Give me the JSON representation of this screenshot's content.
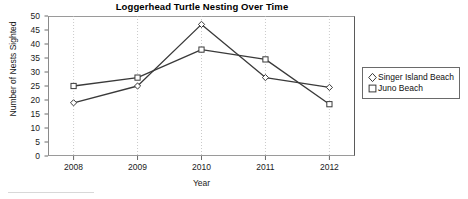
{
  "chart_data": {
    "type": "line",
    "title": "Loggerhead Turtle Nesting Over Time",
    "xlabel": "Year",
    "ylabel": "Number of Nests Sighted",
    "categories": [
      "2008",
      "2009",
      "2010",
      "2011",
      "2012"
    ],
    "x": [
      2008,
      2009,
      2010,
      2011,
      2012
    ],
    "xlim": [
      2007.6,
      2012.4
    ],
    "ylim": [
      0,
      50
    ],
    "yticks": [
      0,
      5,
      10,
      15,
      20,
      25,
      30,
      35,
      40,
      45,
      50
    ],
    "grid": "vertical-dotted",
    "legend_position": "right-outside",
    "series": [
      {
        "name": "Singer Island Beach",
        "marker": "diamond",
        "color": "#3a3a3a",
        "values": [
          19,
          25,
          47,
          28,
          24.5
        ]
      },
      {
        "name": "Juno Beach",
        "marker": "square",
        "color": "#3a3a3a",
        "values": [
          25,
          28,
          38,
          34.5,
          18.5
        ]
      }
    ]
  },
  "legend": {
    "entries": [
      {
        "label": "Singer Island Beach",
        "marker": "diamond-marker-icon"
      },
      {
        "label": "Juno Beach",
        "marker": "square-marker-icon"
      }
    ]
  }
}
